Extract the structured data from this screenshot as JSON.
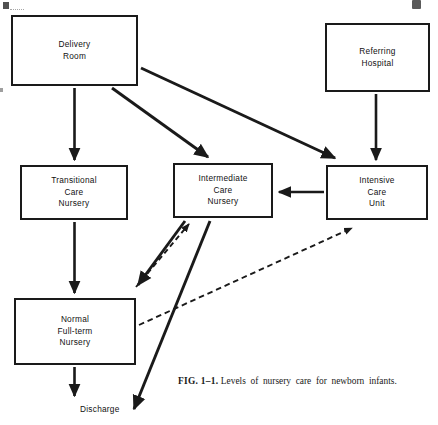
{
  "figure": {
    "caption_label": "FIG. 1–1.",
    "caption_text": "Levels of nursery care for newborn infants.",
    "ink_color": "#1a1a1a",
    "background_color": "#ffffff"
  },
  "nodes": [
    {
      "id": "delivery-room",
      "lines": [
        "Delivery",
        "Room"
      ],
      "x": 11,
      "y": 15,
      "w": 127,
      "h": 71
    },
    {
      "id": "referring-hospital",
      "lines": [
        "Referring",
        "Hospital"
      ],
      "x": 325,
      "y": 23,
      "w": 105,
      "h": 69
    },
    {
      "id": "transitional-care-nursery",
      "lines": [
        "Transitional",
        "Care",
        "Nursery"
      ],
      "x": 20,
      "y": 165,
      "w": 108,
      "h": 55
    },
    {
      "id": "intermediate-care-nursery",
      "lines": [
        "Intermediate",
        "Care",
        "Nursery"
      ],
      "x": 173,
      "y": 163,
      "w": 100,
      "h": 55
    },
    {
      "id": "intensive-care-unit",
      "lines": [
        "Intensive",
        "Care",
        "Unit"
      ],
      "x": 326,
      "y": 165,
      "w": 102,
      "h": 55
    },
    {
      "id": "normal-full-term-nursery",
      "lines": [
        "Normal",
        "Full-term",
        "Nursery"
      ],
      "x": 14,
      "y": 298,
      "w": 122,
      "h": 67
    }
  ],
  "labels": [
    {
      "id": "discharge",
      "text": "Discharge",
      "x": 80,
      "y": 404
    }
  ],
  "edges": [
    {
      "id": "delivery-to-transitional",
      "from": "delivery-room",
      "to": "transitional-care-nursery",
      "style": "solid",
      "direction": "one-way"
    },
    {
      "id": "delivery-to-intermediate",
      "from": "delivery-room",
      "to": "intermediate-care-nursery",
      "style": "solid",
      "direction": "one-way"
    },
    {
      "id": "delivery-to-intensive",
      "from": "delivery-room",
      "to": "intensive-care-unit",
      "style": "solid",
      "direction": "one-way"
    },
    {
      "id": "referring-to-intensive",
      "from": "referring-hospital",
      "to": "intensive-care-unit",
      "style": "solid",
      "direction": "one-way"
    },
    {
      "id": "intensive-to-intermediate",
      "from": "intensive-care-unit",
      "to": "intermediate-care-nursery",
      "style": "solid",
      "direction": "one-way"
    },
    {
      "id": "transitional-to-normal",
      "from": "transitional-care-nursery",
      "to": "normal-full-term-nursery",
      "style": "solid",
      "direction": "one-way"
    },
    {
      "id": "intermediate-to-normal",
      "from": "intermediate-care-nursery",
      "to": "normal-full-term-nursery",
      "style": "solid",
      "direction": "one-way"
    },
    {
      "id": "normal-to-intermediate-return",
      "from": "normal-full-term-nursery",
      "to": "intermediate-care-nursery",
      "style": "dashed",
      "direction": "one-way"
    },
    {
      "id": "normal-to-intensive-return",
      "from": "normal-full-term-nursery",
      "to": "intensive-care-unit",
      "style": "dashed",
      "direction": "one-way"
    },
    {
      "id": "normal-to-discharge",
      "from": "normal-full-term-nursery",
      "to": "discharge",
      "style": "solid",
      "direction": "one-way"
    },
    {
      "id": "intermediate-to-discharge",
      "from": "intermediate-care-nursery",
      "to": "discharge",
      "style": "solid",
      "direction": "one-way"
    }
  ]
}
